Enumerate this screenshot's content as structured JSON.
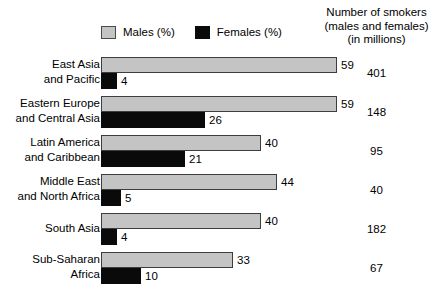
{
  "legend": {
    "items": [
      {
        "label": "Males (%)",
        "swatch": "males-swatch",
        "color": "#c4c4c4"
      },
      {
        "label": "Females (%)",
        "swatch": "females-swatch",
        "color": "#0a0a0a"
      }
    ]
  },
  "right_header": {
    "line1": "Number of smokers",
    "line2": "(males and females)",
    "line3": "(in millions)"
  },
  "chart_data": {
    "type": "bar",
    "orientation": "horizontal",
    "title": "",
    "xlabel": "",
    "ylabel": "",
    "xlim": [
      0,
      59
    ],
    "grid": false,
    "legend_position": "top",
    "categories": [
      "East Asia and Pacific",
      "Eastern Europe and Central Asia",
      "Latin America and Caribbean",
      "Middle East and North Africa",
      "South Asia",
      "Sub-Saharan Africa"
    ],
    "series": [
      {
        "name": "Males (%)",
        "values": [
          59,
          59,
          40,
          44,
          40,
          33
        ]
      },
      {
        "name": "Females (%)",
        "values": [
          4,
          26,
          21,
          5,
          4,
          10
        ]
      }
    ],
    "annotations": {
      "name": "Number of smokers (males and females) (in millions)",
      "values": [
        401,
        148,
        95,
        40,
        182,
        67
      ]
    }
  },
  "rows": [
    {
      "label_line1": "East Asia",
      "label_line2": "and Pacific",
      "males": 59,
      "females": 4,
      "males_text": "59",
      "females_text": "4",
      "smokers": "401"
    },
    {
      "label_line1": "Eastern Europe",
      "label_line2": "and Central Asia",
      "males": 59,
      "females": 26,
      "males_text": "59",
      "females_text": "26",
      "smokers": "148"
    },
    {
      "label_line1": "Latin America",
      "label_line2": "and Caribbean",
      "males": 40,
      "females": 21,
      "males_text": "40",
      "females_text": "21",
      "smokers": "95"
    },
    {
      "label_line1": "Middle East",
      "label_line2": "and North Africa",
      "males": 44,
      "females": 5,
      "males_text": "44",
      "females_text": "5",
      "smokers": "40"
    },
    {
      "label_line1": "South Asia",
      "label_line2": "",
      "males": 40,
      "females": 4,
      "males_text": "40",
      "females_text": "4",
      "smokers": "182"
    },
    {
      "label_line1": "Sub-Saharan",
      "label_line2": "Africa",
      "males": 33,
      "females": 10,
      "males_text": "33",
      "females_text": "10",
      "smokers": "67"
    }
  ]
}
